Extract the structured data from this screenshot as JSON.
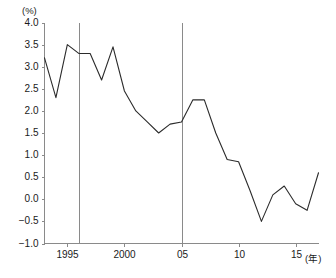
{
  "chart_data": {
    "type": "line",
    "title": "",
    "subtitle": "",
    "xlabel": "(年)",
    "ylabel": "(%)",
    "xlim": [
      1993,
      2017
    ],
    "ylim": [
      -1.0,
      4.0
    ],
    "grid": false,
    "legend": null,
    "y_ticks": [
      "4.0",
      "3.5",
      "3.0",
      "2.5",
      "2.0",
      "1.5",
      "1.0",
      "0.5",
      "0.0",
      "−0.5",
      "−1.0"
    ],
    "y_tick_values": [
      4.0,
      3.5,
      3.0,
      2.5,
      2.0,
      1.5,
      1.0,
      0.5,
      0.0,
      -0.5,
      -1.0
    ],
    "x_ticks": [
      "1995",
      "2000",
      "05",
      "10",
      "15"
    ],
    "x_tick_values": [
      1995,
      2000,
      2005,
      2010,
      2015
    ],
    "x": [
      1993,
      1994,
      1995,
      1996,
      1997,
      1998,
      1999,
      2000,
      2001,
      2002,
      2003,
      2004,
      2005,
      2006,
      2007,
      2008,
      2009,
      2010,
      2011,
      2012,
      2013,
      2014,
      2015,
      2016,
      2017
    ],
    "values": [
      3.2,
      2.3,
      3.5,
      3.3,
      3.3,
      2.7,
      3.45,
      2.45,
      2.0,
      1.75,
      1.5,
      1.7,
      1.75,
      2.25,
      2.25,
      1.5,
      0.9,
      0.85,
      0.2,
      -0.5,
      0.1,
      0.3,
      -0.1,
      -0.25,
      0.6
    ],
    "series_color": "#2b2b2b",
    "reference_lines": [
      {
        "x": 1996,
        "color": "#8a8a8a"
      },
      {
        "x": 2005,
        "color": "#8a8a8a"
      }
    ],
    "axis_color": "#8a8a8a"
  }
}
